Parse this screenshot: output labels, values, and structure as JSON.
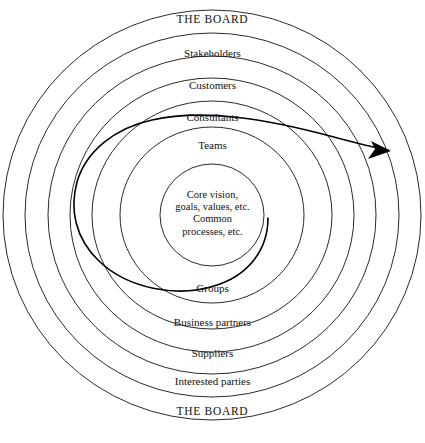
{
  "diagram": {
    "type": "concentric-circles",
    "title_top": "THE BOARD",
    "title_bottom": "THE BOARD",
    "center": {
      "x": 212,
      "y": 215
    },
    "stroke_color": "#2b2b2b",
    "spiral_color": "#000000",
    "background_color": "#ffffff",
    "rings": [
      {
        "label": "THE BOARD",
        "rx": 209,
        "ry": 205,
        "label_y": 19,
        "style": "board"
      },
      {
        "label": "Stakeholders",
        "rx": 187,
        "ry": 182,
        "label_y": 52,
        "style": "normal"
      },
      {
        "label": "Customers",
        "rx": 164,
        "ry": 159,
        "label_y": 84,
        "style": "normal"
      },
      {
        "label": "Consultants",
        "rx": 142,
        "ry": 137,
        "label_y": 116,
        "style": "normal"
      },
      {
        "label": "Teams",
        "rx": 120,
        "ry": 114,
        "label_y": 144,
        "style": "normal"
      },
      {
        "label": "Groups",
        "rx": 92,
        "ry": 88,
        "label_y": 287,
        "style": "normal"
      },
      {
        "label": "Business partners",
        "rx": 120,
        "ry": 114,
        "label_y": 321,
        "style": "normal"
      },
      {
        "label": "Suppliers",
        "rx": 142,
        "ry": 137,
        "label_y": 352,
        "style": "normal"
      },
      {
        "label": "Interested parties",
        "rx": 164,
        "ry": 159,
        "label_y": 380,
        "style": "normal"
      },
      {
        "label": "THE BOARD",
        "rx": 187,
        "ry": 182,
        "label_y": 410,
        "style": "board"
      }
    ],
    "ring_radii": [
      209,
      187,
      164,
      142,
      120,
      92,
      52
    ],
    "core": {
      "radius": 52,
      "lines": [
        "Core vision,",
        "goals, values, etc.",
        "Common",
        "processes, etc."
      ],
      "text_top": 189
    },
    "spiral": {
      "description": "spiral arrow sweeping outward from the core to outside the outer ring",
      "arrow_tip": {
        "x": 391,
        "y": 150
      },
      "inner_end": {
        "x": 268,
        "y": 218
      }
    }
  }
}
